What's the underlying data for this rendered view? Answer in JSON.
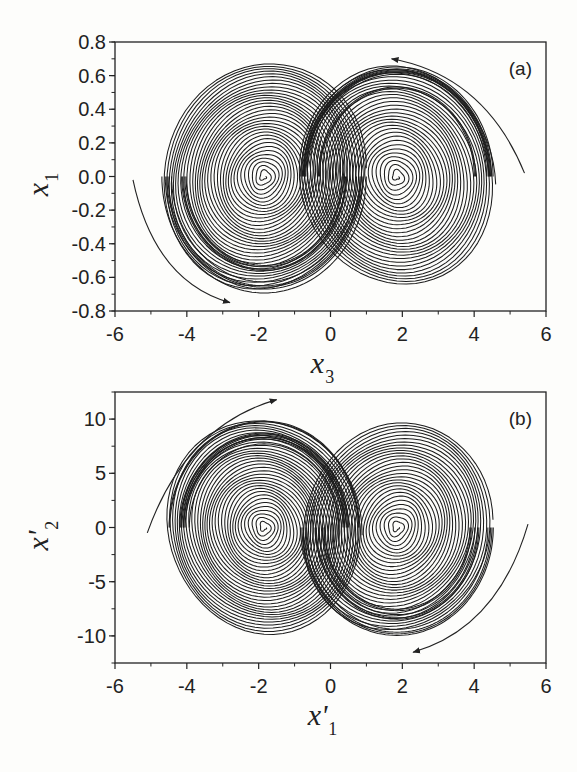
{
  "chart_data": [
    {
      "type": "line",
      "panel_label": "(a)",
      "title": "",
      "xlabel": "x3",
      "xlabel_main": "x",
      "xlabel_sub": "3",
      "ylabel": "x1",
      "ylabel_main": "x",
      "ylabel_sub": "1",
      "xlim": [
        -6,
        6
      ],
      "ylim": [
        -0.8,
        0.8
      ],
      "xticks": [
        "-6",
        "-4",
        "-2",
        "0",
        "2",
        "4",
        "6"
      ],
      "yticks": [
        "0.8",
        "0.6",
        "0.4",
        "0.2",
        "0.0",
        "-0.2",
        "-0.4",
        "-0.6",
        "-0.8"
      ],
      "grid": false,
      "description": "Double-scroll chaotic attractor phase portrait in x3–x1 plane",
      "attractor": {
        "left_focus": {
          "x": -1.85,
          "y": 0.0
        },
        "right_focus": {
          "x": 1.85,
          "y": 0.0
        },
        "x_extent": [
          -4.7,
          4.6
        ],
        "y_extent": [
          -0.68,
          0.68
        ]
      },
      "arrows": [
        {
          "from": [
            5.4,
            0.02
          ],
          "to": [
            1.7,
            0.7
          ],
          "direction": "counterclockwise-top"
        },
        {
          "from": [
            -5.5,
            -0.02
          ],
          "to": [
            -2.8,
            -0.75
          ],
          "direction": "counterclockwise-bottom"
        }
      ]
    },
    {
      "type": "line",
      "panel_label": "(b)",
      "title": "",
      "xlabel": "x'1",
      "xlabel_main": "x'",
      "xlabel_sub": "1",
      "ylabel": "x'2",
      "ylabel_main": "x'",
      "ylabel_sub": "2",
      "xlim": [
        -6,
        6
      ],
      "ylim": [
        -12.5,
        12.5
      ],
      "xticks": [
        "-6",
        "-4",
        "-2",
        "0",
        "2",
        "4",
        "6"
      ],
      "yticks": [
        "10",
        "5",
        "0",
        "-5",
        "-10"
      ],
      "grid": false,
      "description": "Double-scroll chaotic attractor phase portrait in x'1–x'2 plane",
      "attractor": {
        "left_focus": {
          "x": -1.85,
          "y": 0.0
        },
        "right_focus": {
          "x": 1.85,
          "y": 0.0
        },
        "x_extent": [
          -4.6,
          4.6
        ],
        "y_extent": [
          -10.0,
          10.0
        ]
      },
      "arrows": [
        {
          "from": [
            -5.1,
            -0.5
          ],
          "to": [
            -1.5,
            11.8
          ],
          "direction": "clockwise-top"
        },
        {
          "from": [
            5.5,
            0.3
          ],
          "to": [
            2.3,
            -11.5
          ],
          "direction": "clockwise-bottom"
        }
      ]
    }
  ]
}
